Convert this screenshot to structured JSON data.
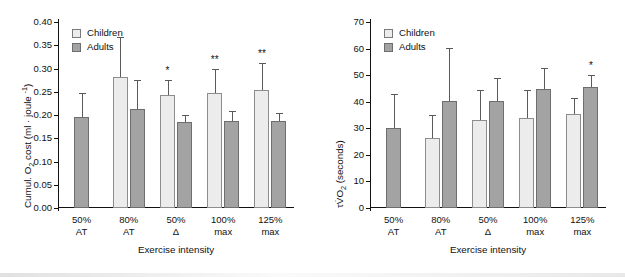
{
  "figure": {
    "panels": [
      "left",
      "right"
    ]
  },
  "legend": {
    "children_label": "Children",
    "adults_label": "Adults",
    "children_color": "#ececec",
    "adults_color": "#a3a3a3"
  },
  "axis": {
    "xlabel": "Exercise intensity"
  },
  "chart_data": [
    {
      "type": "bar",
      "panel": "left",
      "title": "",
      "xlabel": "Exercise intensity",
      "ylabel": "Cumul. O2 cost (ml · joule -1)",
      "ylabel_parts": {
        "prefix": "Cumul. O",
        "sub": "2",
        "middle": " cost (ml · joule ",
        "sup": "-1",
        "suffix": ")"
      },
      "ylim": [
        0.0,
        0.4
      ],
      "yticks": [
        "0.00",
        "0.05",
        "0.10",
        "0.15",
        "0.20",
        "0.25",
        "0.30",
        "0.35",
        "0.40"
      ],
      "ytick_values": [
        0.0,
        0.05,
        0.1,
        0.15,
        0.2,
        0.25,
        0.3,
        0.35,
        0.4
      ],
      "grid": false,
      "legend_position": "top-left",
      "categories": [
        "50% AT",
        "80% AT",
        "50% Δ",
        "100% max",
        "125% max"
      ],
      "category_lines": [
        [
          "50%",
          "AT"
        ],
        [
          "80%",
          "AT"
        ],
        [
          "50%",
          "Δ"
        ],
        [
          "100%",
          "max"
        ],
        [
          "125%",
          "max"
        ]
      ],
      "series": [
        {
          "name": "Children",
          "values": [
            null,
            0.282,
            0.243,
            0.248,
            0.253
          ],
          "errors": [
            null,
            0.085,
            0.033,
            0.052,
            0.059
          ],
          "significance": [
            "",
            "",
            "*",
            "**",
            "**"
          ]
        },
        {
          "name": "Adults",
          "values": [
            0.195,
            0.212,
            0.184,
            0.187,
            0.188
          ],
          "errors": [
            0.053,
            0.064,
            0.016,
            0.021,
            0.017
          ],
          "significance": [
            "",
            "",
            "",
            "",
            ""
          ]
        }
      ]
    },
    {
      "type": "bar",
      "panel": "right",
      "title": "",
      "xlabel": "Exercise intensity",
      "ylabel": "τV̇O2 (seconds)",
      "ylabel_parts": {
        "prefix": "τV̇O",
        "sub": "2",
        "middle": " (seconds)",
        "sup": "",
        "suffix": ""
      },
      "ylim": [
        0,
        70
      ],
      "yticks": [
        "0",
        "10",
        "20",
        "30",
        "40",
        "50",
        "60",
        "70"
      ],
      "ytick_values": [
        0,
        10,
        20,
        30,
        40,
        50,
        60,
        70
      ],
      "grid": false,
      "legend_position": "top-left",
      "categories": [
        "50% AT",
        "80% AT",
        "50% Δ",
        "100% max",
        "125% max"
      ],
      "category_lines": [
        [
          "50%",
          "AT"
        ],
        [
          "80%",
          "AT"
        ],
        [
          "50%",
          "Δ"
        ],
        [
          "100%",
          "max"
        ],
        [
          "125%",
          "max"
        ]
      ],
      "series": [
        {
          "name": "Children",
          "values": [
            null,
            26.4,
            33.2,
            33.9,
            35.3
          ],
          "errors": [
            null,
            8.7,
            11.2,
            10.6,
            6.2
          ],
          "significance": [
            "",
            "",
            "",
            "",
            ""
          ]
        },
        {
          "name": "Adults",
          "values": [
            30.0,
            40.1,
            40.4,
            44.7,
            45.7
          ],
          "errors": [
            12.8,
            20.1,
            8.4,
            8.0,
            4.2
          ],
          "significance": [
            "",
            "",
            "",
            "",
            "*"
          ]
        }
      ]
    }
  ]
}
